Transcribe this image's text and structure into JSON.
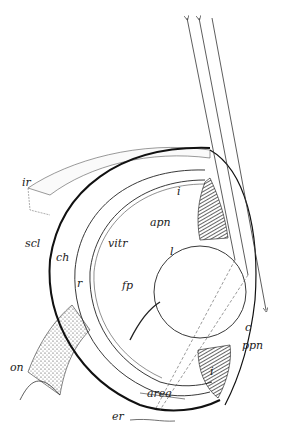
{
  "figure": {
    "labels": {
      "ir": "ir",
      "scl": "scl",
      "ch": "ch",
      "r": "r",
      "vitr": "vitr",
      "fp": "fp",
      "on": "on",
      "i": "i",
      "apn": "apn",
      "l": "l",
      "c": "c",
      "ppn": "ppn",
      "area": "area",
      "er": "er"
    },
    "ray_count": 3,
    "colors": {
      "ink": "#222222",
      "background": "#ffffff"
    }
  }
}
